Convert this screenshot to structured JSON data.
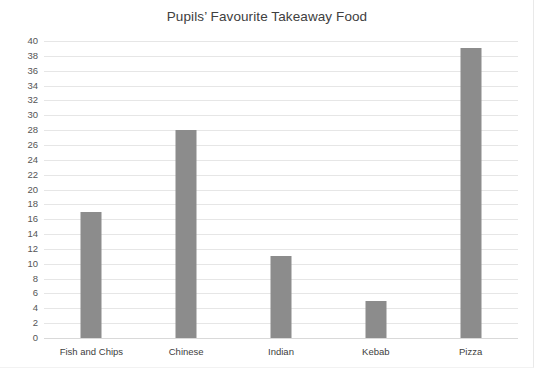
{
  "chart_data": {
    "type": "bar",
    "title": "Pupils’ Favourite Takeaway Food",
    "xlabel": "",
    "ylabel": "",
    "categories": [
      "Fish and Chips",
      "Chinese",
      "Indian",
      "Kebab",
      "Pizza"
    ],
    "values": [
      17,
      28,
      11,
      5,
      39
    ],
    "ylim": [
      0,
      40
    ],
    "ytick_step": 2,
    "yticks": [
      0,
      2,
      4,
      6,
      8,
      10,
      12,
      14,
      16,
      18,
      20,
      22,
      24,
      26,
      28,
      30,
      32,
      34,
      36,
      38,
      40
    ],
    "ytick_labels": [
      "0",
      "2",
      "4",
      "6",
      "8",
      "10",
      "12",
      "14",
      "16",
      "18",
      "20",
      "22",
      "24",
      "26",
      "28",
      "30",
      "32",
      "34",
      "36",
      "38",
      "40"
    ],
    "grid": true,
    "grid_axis": "y",
    "legend": false,
    "legend_position": "none",
    "bar_color": "#8c8c8c",
    "grid_color": "#e6e6e6",
    "axis_color": "#d9d9d9",
    "background": "#ffffff",
    "text_color": "#404040"
  }
}
